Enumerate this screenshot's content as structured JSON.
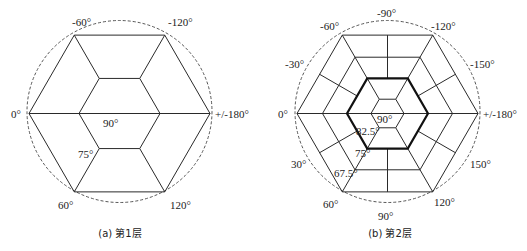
{
  "figures": [
    {
      "id": "a",
      "caption": "(a) 第1层",
      "center": [
        119.5,
        113.5
      ],
      "circle": {
        "rx": 92.5,
        "ry": 91
      },
      "outer_radius": 90.5,
      "inner_radius": 40.5,
      "outer_labels": [
        {
          "text": "-60°",
          "x": 72,
          "y": 26
        },
        {
          "text": "-120°",
          "x": 168,
          "y": 26
        },
        {
          "text": "0°",
          "x": 11,
          "y": 118
        },
        {
          "text": "+/-180°",
          "x": 215,
          "y": 118
        },
        {
          "text": "60°",
          "x": 58,
          "y": 209
        },
        {
          "text": "120°",
          "x": 170,
          "y": 209
        }
      ],
      "inner_labels": [
        {
          "text": "90°",
          "x": 103,
          "y": 127
        },
        {
          "text": "75°",
          "x": 78,
          "y": 158
        }
      ]
    },
    {
      "id": "b",
      "caption": "(b) 第2层",
      "center": [
        387.5,
        113.5
      ],
      "circle": {
        "rx": 92.5,
        "ry": 91
      },
      "outer_radius": 90.5,
      "middle_radius": 65,
      "bold_radius": 40.5,
      "inner_radius": 16.5,
      "outer_labels": [
        {
          "text": "-90°",
          "x": 377,
          "y": 17
        },
        {
          "text": "-60°",
          "x": 320,
          "y": 30
        },
        {
          "text": "-120°",
          "x": 431,
          "y": 30
        },
        {
          "text": "-30°",
          "x": 285,
          "y": 68
        },
        {
          "text": "-150°",
          "x": 470,
          "y": 68
        },
        {
          "text": "0°",
          "x": 278,
          "y": 118
        },
        {
          "text": "+/-180°",
          "x": 483,
          "y": 118
        },
        {
          "text": "30°",
          "x": 291,
          "y": 168
        },
        {
          "text": "150°",
          "x": 470,
          "y": 168
        },
        {
          "text": "60°",
          "x": 323,
          "y": 208
        },
        {
          "text": "120°",
          "x": 434,
          "y": 206
        },
        {
          "text": "90°",
          "x": 378,
          "y": 220
        }
      ],
      "inner_labels": [
        {
          "text": "90°",
          "x": 377,
          "y": 123
        },
        {
          "text": "82.5°",
          "x": 356,
          "y": 135
        },
        {
          "text": "75°",
          "x": 355,
          "y": 157
        },
        {
          "text": "67.5°",
          "x": 334,
          "y": 177
        }
      ]
    }
  ]
}
